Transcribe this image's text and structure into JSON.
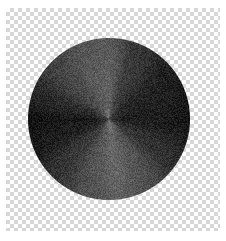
{
  "image": {
    "title": "Noisy angular gradient disc on transparency checkerboard",
    "width": 226,
    "height": 241,
    "background_color": "#ffffff"
  },
  "checkerboard": {
    "name": "transparency-checker",
    "light_color": "#ffffff",
    "dark_color": "#d7d7d7",
    "cell_size": 4,
    "left": 6,
    "top": 8,
    "width": 214,
    "height": 223
  },
  "disc": {
    "name": "conic-gradient-disc",
    "center_x": 109,
    "center_y": 119,
    "radius": 81,
    "gradient_type": "conic",
    "noise": {
      "enabled": true,
      "amplitude": 34,
      "grain": "film-grain"
    },
    "stops": [
      {
        "angle_deg": 0,
        "value": 96
      },
      {
        "angle_deg": 22,
        "value": 62
      },
      {
        "angle_deg": 55,
        "value": 38
      },
      {
        "angle_deg": 90,
        "value": 30
      },
      {
        "angle_deg": 120,
        "value": 52
      },
      {
        "angle_deg": 150,
        "value": 86
      },
      {
        "angle_deg": 172,
        "value": 104
      },
      {
        "angle_deg": 195,
        "value": 88
      },
      {
        "angle_deg": 225,
        "value": 58
      },
      {
        "angle_deg": 250,
        "value": 34
      },
      {
        "angle_deg": 268,
        "value": 26
      },
      {
        "angle_deg": 288,
        "value": 46
      },
      {
        "angle_deg": 315,
        "value": 74
      },
      {
        "angle_deg": 340,
        "value": 92
      },
      {
        "angle_deg": 360,
        "value": 96
      }
    ],
    "radial_falloff": {
      "enabled": true,
      "center_boost": 20,
      "edge_darken": 10
    },
    "color_min": "#161616",
    "color_max": "#8f8f8f"
  }
}
